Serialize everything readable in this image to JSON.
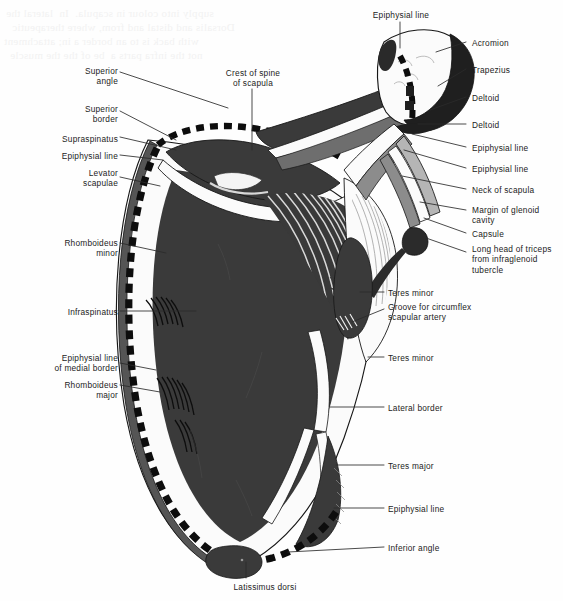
{
  "figure": {
    "colors": {
      "background": "#fefefe",
      "bone_light": "#fbfbfb",
      "muscle_dark": "#3a3a3a",
      "muscle_mid": "#6e6e6e",
      "muscle_deep": "#1f1f1f",
      "outline": "#111111",
      "leader": "#2a2a2a",
      "epiphysial_dash": "#0d0d0d",
      "label_text": "#1c1c1c",
      "bleed_text": "#f2f2f2"
    },
    "bleed_through_text": {
      "line1": "supply into colour in scapula.  In  lateral the",
      "line2": "Dorsalis and distal and from, where therapeutic",
      "line3": "with back is to an border a in; attachment",
      "line4": "not the infra parts a  be of the the muscle"
    }
  },
  "labels_left": [
    {
      "id": "superior-angle",
      "text": "Superior\nangle",
      "x": 45,
      "y": 66,
      "width": 73
    },
    {
      "id": "superior-border",
      "text": "Superior\nborder",
      "x": 45,
      "y": 104,
      "width": 73
    },
    {
      "id": "supraspinatus",
      "text": "Supraspinatus",
      "x": 25,
      "y": 134,
      "width": 93
    },
    {
      "id": "epiphysial-line-medial-upper",
      "text": "Epiphysial line",
      "x": 25,
      "y": 151,
      "width": 93
    },
    {
      "id": "levator-scapulae",
      "text": "Levator\nscapulae",
      "x": 45,
      "y": 168,
      "width": 73
    },
    {
      "id": "rhomboideus-minor",
      "text": "Rhomboideus\nminor",
      "x": 24,
      "y": 238,
      "width": 94
    },
    {
      "id": "infraspinatus",
      "text": "Infraspinatus",
      "x": 28,
      "y": 307,
      "width": 90
    },
    {
      "id": "epiphysial-line-medial-border",
      "text": "Epiphysial line\nof medial border",
      "x": 24,
      "y": 353,
      "width": 94
    },
    {
      "id": "rhomboideus-major",
      "text": "Rhomboideus\nmajor",
      "x": 24,
      "y": 380,
      "width": 94
    }
  ],
  "labels_right": [
    {
      "id": "acromion",
      "text": "Acromion",
      "x": 472,
      "y": 38,
      "width": 90
    },
    {
      "id": "trapezius",
      "text": "Trapezius",
      "x": 472,
      "y": 65,
      "width": 90
    },
    {
      "id": "deltoid-upper",
      "text": "Deltoid",
      "x": 472,
      "y": 93,
      "width": 90
    },
    {
      "id": "deltoid-lower",
      "text": "Deltoid",
      "x": 472,
      "y": 120,
      "width": 90
    },
    {
      "id": "epiphysial-line-right-1",
      "text": "Epiphysial line",
      "x": 472,
      "y": 143,
      "width": 90
    },
    {
      "id": "epiphysial-line-right-2",
      "text": "Epiphysial line",
      "x": 472,
      "y": 164,
      "width": 90
    },
    {
      "id": "neck-of-scapula",
      "text": "Neck of scapula",
      "x": 472,
      "y": 185,
      "width": 90
    },
    {
      "id": "margin-of-glenoid",
      "text": "Margin of glenoid\ncavity",
      "x": 472,
      "y": 205,
      "width": 90
    },
    {
      "id": "capsule",
      "text": "Capsule",
      "x": 472,
      "y": 229,
      "width": 90
    },
    {
      "id": "long-head-triceps",
      "text": "Long head of triceps\nfrom infraglenoid\ntubercle",
      "x": 472,
      "y": 244,
      "width": 90
    },
    {
      "id": "teres-minor-upper",
      "text": "Teres minor",
      "x": 388,
      "y": 288,
      "width": 120
    },
    {
      "id": "groove-circumflex",
      "text": "Groove for circumflex\nscapular artery",
      "x": 388,
      "y": 302,
      "width": 160
    },
    {
      "id": "teres-minor-lower",
      "text": "Teres minor",
      "x": 388,
      "y": 353,
      "width": 120
    },
    {
      "id": "lateral-border",
      "text": "Lateral border",
      "x": 388,
      "y": 403,
      "width": 120
    },
    {
      "id": "teres-major",
      "text": "Teres major",
      "x": 388,
      "y": 461,
      "width": 120
    },
    {
      "id": "epiphysial-line-lateral",
      "text": "Epiphysial line",
      "x": 388,
      "y": 504,
      "width": 120
    },
    {
      "id": "inferior-angle",
      "text": "Inferior angle",
      "x": 388,
      "y": 543,
      "width": 120
    }
  ],
  "labels_top": [
    {
      "id": "epiphysial-line-top",
      "text": "Epiphysial line",
      "x": 346,
      "y": 10,
      "width": 110
    },
    {
      "id": "crest-of-spine",
      "text": "Crest of spine\nof scapula",
      "x": 198,
      "y": 68,
      "width": 110
    }
  ],
  "labels_bottom": [
    {
      "id": "latissimus-dorsi",
      "text": "Latissimus dorsi",
      "x": 210,
      "y": 582,
      "width": 110
    }
  ]
}
